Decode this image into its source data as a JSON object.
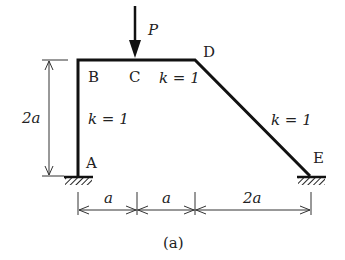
{
  "diagram": {
    "type": "frame-structure",
    "caption": "(a)",
    "load": {
      "label": "P",
      "at": "C",
      "direction": "down"
    },
    "nodes": {
      "A": "A",
      "B": "B",
      "C": "C",
      "D": "D",
      "E": "E"
    },
    "members": [
      {
        "from": "A",
        "to": "B",
        "stiffness": "k = 1"
      },
      {
        "from": "B",
        "to": "D",
        "stiffness": "k = 1"
      },
      {
        "from": "D",
        "to": "E",
        "stiffness": "k = 1"
      }
    ],
    "supports": [
      {
        "node": "A",
        "type": "fixed"
      },
      {
        "node": "E",
        "type": "fixed"
      }
    ],
    "dimensions": {
      "height": "2a",
      "horizontal": [
        "a",
        "a",
        "2a"
      ]
    }
  }
}
